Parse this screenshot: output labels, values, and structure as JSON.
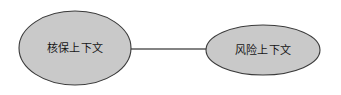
{
  "diagram": {
    "type": "node-link-graph",
    "background_color": "#ffffff",
    "node_fill_color": "#c9c9c9",
    "node_stroke_color": "#3a3a3a",
    "edge_color": "#5a5a5a",
    "label_color": "#161616",
    "nodes": [
      {
        "id": "underwriting-context",
        "label": "核保上下文",
        "shape": "ellipse",
        "cx": 75,
        "cy": 48,
        "rx": 56,
        "ry": 37
      },
      {
        "id": "risk-context",
        "label": "风险上下文",
        "shape": "ellipse",
        "cx": 263,
        "cy": 50,
        "rx": 57,
        "ry": 25
      }
    ],
    "edges": [
      {
        "id": "underwriting-to-risk",
        "from": "underwriting-context",
        "to": "risk-context",
        "label": "",
        "x1": 131,
        "y1": 49,
        "x2": 206,
        "y2": 49
      }
    ]
  }
}
